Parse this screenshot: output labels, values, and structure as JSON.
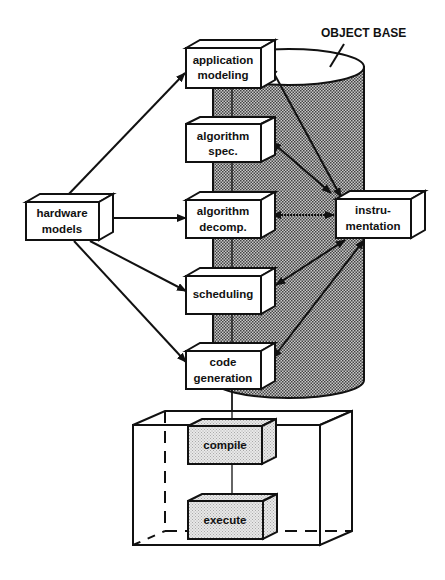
{
  "diagram": {
    "object_base_label": "OBJECT BASE",
    "nodes": {
      "application_modeling": {
        "line1": "application",
        "line2": "modeling"
      },
      "algorithm_spec": {
        "line1": "algorithm",
        "line2": "spec."
      },
      "algorithm_decomp": {
        "line1": "algorithm",
        "line2": "decomp."
      },
      "scheduling": {
        "line1": "scheduling"
      },
      "code_generation": {
        "line1": "code",
        "line2": "generation"
      },
      "hardware_models": {
        "line1": "hardware",
        "line2": "models"
      },
      "instrumentation": {
        "line1": "instru-",
        "line2": "mentation"
      },
      "compile": {
        "line1": "compile"
      },
      "execute": {
        "line1": "execute"
      }
    },
    "edges": [
      {
        "from": "hardware models",
        "to": "application modeling",
        "type": "arrow"
      },
      {
        "from": "hardware models",
        "to": "algorithm decomp.",
        "type": "arrow"
      },
      {
        "from": "hardware models",
        "to": "scheduling",
        "type": "arrow"
      },
      {
        "from": "hardware models",
        "to": "code generation",
        "type": "arrow"
      },
      {
        "from": "instrumentation",
        "to": "application modeling",
        "type": "bidirectional"
      },
      {
        "from": "instrumentation",
        "to": "algorithm spec.",
        "type": "bidirectional"
      },
      {
        "from": "instrumentation",
        "to": "algorithm decomp.",
        "type": "bidirectional"
      },
      {
        "from": "instrumentation",
        "to": "scheduling",
        "type": "bidirectional"
      },
      {
        "from": "instrumentation",
        "to": "code generation",
        "type": "bidirectional"
      },
      {
        "from": "code generation",
        "to": "compile",
        "type": "line"
      },
      {
        "from": "compile",
        "to": "execute",
        "type": "line"
      }
    ],
    "colors": {
      "ink": "#111111",
      "background": "#ffffff",
      "shade": "#9a9a9a"
    }
  }
}
